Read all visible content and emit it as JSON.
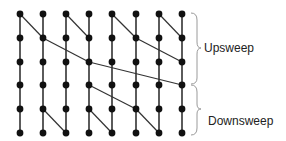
{
  "diagram": {
    "type": "parallel-prefix-scan",
    "columns": 8,
    "rows": 6,
    "col_x": [
      20,
      43,
      66,
      89,
      112,
      136,
      159,
      182
    ],
    "row_y": [
      14,
      38,
      62,
      85,
      109,
      133
    ],
    "node_color": "#111111",
    "edge_color": "#333333",
    "brace_color": "#999999",
    "upsweep_edges": [
      [
        0,
        0,
        1,
        1
      ],
      [
        0,
        2,
        1,
        3
      ],
      [
        0,
        4,
        1,
        5
      ],
      [
        0,
        6,
        1,
        7
      ],
      [
        1,
        1,
        2,
        3
      ],
      [
        1,
        5,
        2,
        7
      ],
      [
        2,
        3,
        3,
        7
      ]
    ],
    "downsweep_edges": [
      [
        3,
        3,
        4,
        5
      ],
      [
        4,
        1,
        5,
        2
      ],
      [
        4,
        3,
        5,
        4
      ],
      [
        4,
        5,
        5,
        6
      ]
    ]
  },
  "labels": {
    "upsweep": "Upsweep",
    "downsweep": "Downsweep"
  }
}
